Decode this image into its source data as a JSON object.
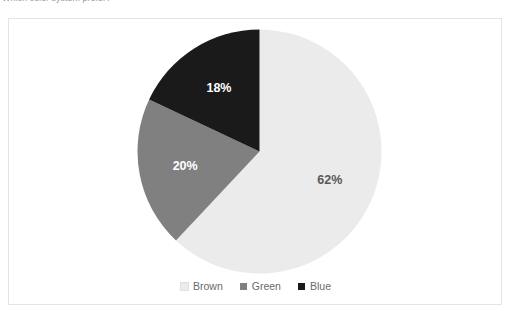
{
  "caption": {
    "clipped_text": "Which color system prefer?"
  },
  "legend": {
    "position": "bottom-center",
    "items": [
      {
        "label": "Brown",
        "color": "#ebebeb",
        "marker": "square-swatch"
      },
      {
        "label": "Green",
        "color": "#808080",
        "marker": "square-swatch"
      },
      {
        "label": "Blue",
        "color": "#1a1a1a",
        "marker": "square-swatch"
      }
    ]
  },
  "chart_data": {
    "type": "pie",
    "title": "",
    "xlabel": "",
    "ylabel": "",
    "grid": false,
    "legend_position": "bottom-center",
    "start_angle_deg": 0,
    "direction": "clockwise",
    "categories": [
      "Brown",
      "Green",
      "Blue"
    ],
    "values": [
      62,
      20,
      18
    ],
    "value_unit": "%",
    "colors": [
      "#ebebeb",
      "#808080",
      "#1a1a1a"
    ],
    "data_labels": [
      "62%",
      "20%",
      "18%"
    ],
    "data_label_colors": [
      "#595959",
      "#ffffff",
      "#ffffff"
    ],
    "slices": [
      {
        "name": "Brown",
        "value": 62,
        "label": "62%",
        "color": "#ebebeb",
        "label_color": "#595959"
      },
      {
        "name": "Green",
        "value": 20,
        "label": "20%",
        "color": "#808080",
        "label_color": "#ffffff"
      },
      {
        "name": "Blue",
        "value": 18,
        "label": "18%",
        "color": "#1a1a1a",
        "label_color": "#ffffff"
      }
    ]
  },
  "frame": {
    "border_color": "#e4e4e4",
    "background": "#ffffff"
  }
}
